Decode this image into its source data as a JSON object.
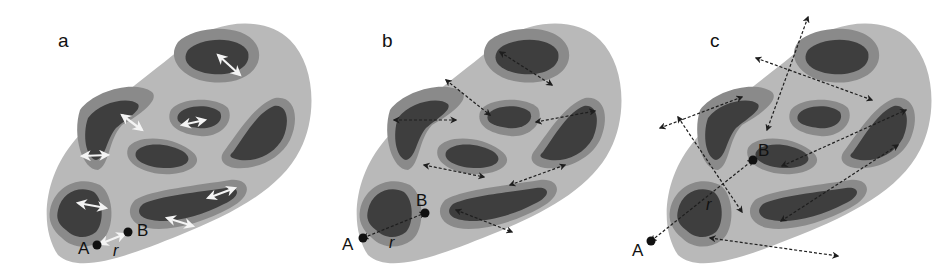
{
  "figure": {
    "colors": {
      "background": "#ffffff",
      "outer_region": "#b9b9b9",
      "ring_light": "#a6a6a6",
      "ring_mid": "#8a8a8a",
      "ring_dark": "#707070",
      "basin": "#3e3e3e",
      "arrow_white": "#f4f4f4",
      "arrow_dark": "#1e1e1e"
    },
    "panels": [
      {
        "id": "a",
        "label": "a",
        "offset_x": 0,
        "label_pos": [
          58,
          47
        ],
        "point_A": {
          "label": "A",
          "pos": [
            97,
            245
          ],
          "label_pos": [
            78,
            254
          ]
        },
        "point_B": {
          "label": "B",
          "pos": [
            128,
            232
          ],
          "label_pos": [
            137,
            236
          ]
        },
        "r_label": {
          "label": "r",
          "pos": [
            113,
            256
          ]
        },
        "arrow_style": "white",
        "arrows": [
          [
            [
              100,
              244
            ],
            [
              125,
              234
            ]
          ],
          [
            [
              218,
              55
            ],
            [
              240,
              75
            ]
          ],
          [
            [
              182,
              125
            ],
            [
              205,
              120
            ]
          ],
          [
            [
              122,
              115
            ],
            [
              142,
              130
            ]
          ],
          [
            [
              82,
              156
            ],
            [
              108,
              155
            ]
          ],
          [
            [
              78,
              203
            ],
            [
              106,
              208
            ]
          ],
          [
            [
              208,
              198
            ],
            [
              235,
              188
            ]
          ],
          [
            [
              167,
              218
            ],
            [
              193,
              226
            ]
          ]
        ]
      },
      {
        "id": "b",
        "label": "b",
        "offset_x": 310,
        "label_pos": [
          382,
          47
        ],
        "point_A": {
          "label": "A",
          "pos": [
            363,
            238
          ],
          "label_pos": [
            342,
            250
          ]
        },
        "point_B": {
          "label": "B",
          "pos": [
            425,
            213
          ],
          "label_pos": [
            416,
            206
          ]
        },
        "r_label": {
          "label": "r",
          "pos": [
            389,
            248
          ]
        },
        "arrow_style": "dark",
        "arrows": [
          [
            [
              363,
              238
            ],
            [
              425,
              213
            ]
          ],
          [
            [
              500,
              52
            ],
            [
              552,
              85
            ]
          ],
          [
            [
              446,
              80
            ],
            [
              490,
              115
            ]
          ],
          [
            [
              394,
              120
            ],
            [
              456,
              120
            ]
          ],
          [
            [
              536,
              122
            ],
            [
              595,
              111
            ]
          ],
          [
            [
              424,
              165
            ],
            [
              484,
              177
            ]
          ],
          [
            [
              510,
              185
            ],
            [
              565,
              165
            ]
          ],
          [
            [
              456,
              210
            ],
            [
              512,
              232
            ]
          ]
        ]
      },
      {
        "id": "c",
        "label": "c",
        "offset_x": 620,
        "label_pos": [
          710,
          47
        ],
        "point_A": {
          "label": "A",
          "pos": [
            651,
            241
          ],
          "label_pos": [
            632,
            256
          ]
        },
        "point_B": {
          "label": "B",
          "pos": [
            753,
            160
          ],
          "label_pos": [
            758,
            156
          ]
        },
        "r_label": {
          "label": "r",
          "pos": [
            706,
            210
          ]
        },
        "arrow_style": "dark",
        "arrows": [
          [
            [
              651,
              241
            ],
            [
              753,
              160
            ]
          ],
          [
            [
              808,
              17
            ],
            [
              767,
              130
            ]
          ],
          [
            [
              756,
              58
            ],
            [
              872,
              100
            ]
          ],
          [
            [
              742,
              97
            ],
            [
              660,
              128
            ]
          ],
          [
            [
              678,
              117
            ],
            [
              742,
              212
            ]
          ],
          [
            [
              782,
              166
            ],
            [
              906,
              110
            ]
          ],
          [
            [
              781,
              221
            ],
            [
              898,
              145
            ]
          ],
          [
            [
              710,
              238
            ],
            [
              838,
              256
            ]
          ]
        ]
      }
    ]
  }
}
